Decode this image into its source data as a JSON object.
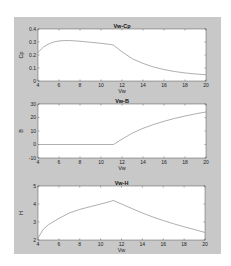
{
  "chart_data": [
    {
      "type": "line",
      "title": "Vw-Cp",
      "xlabel": "Vw",
      "ylabel": "Cp",
      "xlim": [
        4,
        20
      ],
      "ylim": [
        0,
        0.4
      ],
      "xticks": [
        4,
        6,
        8,
        10,
        12,
        14,
        16,
        18,
        20
      ],
      "yticks": [
        0,
        0.1,
        0.2,
        0.3,
        0.4
      ],
      "grid": false,
      "x": [
        4,
        4.5,
        5,
        5.5,
        6,
        6.5,
        7,
        8,
        9,
        10,
        11,
        11.2,
        12,
        13,
        14,
        15,
        16,
        17,
        18,
        19,
        20
      ],
      "values": [
        0.22,
        0.26,
        0.285,
        0.3,
        0.308,
        0.311,
        0.311,
        0.306,
        0.298,
        0.29,
        0.28,
        0.275,
        0.225,
        0.17,
        0.135,
        0.108,
        0.088,
        0.073,
        0.062,
        0.054,
        0.048
      ]
    },
    {
      "type": "line",
      "title": "Vw-B",
      "xlabel": "Vw",
      "ylabel": "B",
      "xlim": [
        4,
        20
      ],
      "ylim": [
        -10,
        30
      ],
      "xticks": [
        4,
        6,
        8,
        10,
        12,
        14,
        16,
        18,
        20
      ],
      "yticks": [
        -10,
        0,
        10,
        20,
        30
      ],
      "grid": false,
      "x": [
        4,
        6,
        8,
        10,
        11.2,
        12,
        13,
        14,
        15,
        16,
        17,
        18,
        19,
        20
      ],
      "values": [
        0,
        0,
        0,
        0,
        0,
        4,
        8.5,
        12,
        14.8,
        17.2,
        19.3,
        21.1,
        22.7,
        24.1
      ]
    },
    {
      "type": "line",
      "title": "Vw-H",
      "xlabel": "Vw",
      "ylabel": "H",
      "xlim": [
        4,
        20
      ],
      "ylim": [
        2,
        5
      ],
      "xticks": [
        4,
        6,
        8,
        10,
        12,
        14,
        16,
        18,
        20
      ],
      "yticks": [
        2,
        3,
        4,
        5
      ],
      "grid": false,
      "x": [
        4,
        4.5,
        5,
        6,
        7,
        8,
        9,
        10,
        11,
        11.2,
        12,
        13,
        14,
        15,
        16,
        17,
        18,
        19,
        20
      ],
      "values": [
        2.1,
        2.6,
        2.85,
        3.2,
        3.5,
        3.7,
        3.85,
        4.0,
        4.15,
        4.2,
        4.0,
        3.75,
        3.5,
        3.28,
        3.08,
        2.9,
        2.73,
        2.58,
        2.42
      ]
    }
  ],
  "figure": {
    "background": "#c8c8c8",
    "axes_background": "#ffffff",
    "line_color": "#8c8c8c"
  }
}
